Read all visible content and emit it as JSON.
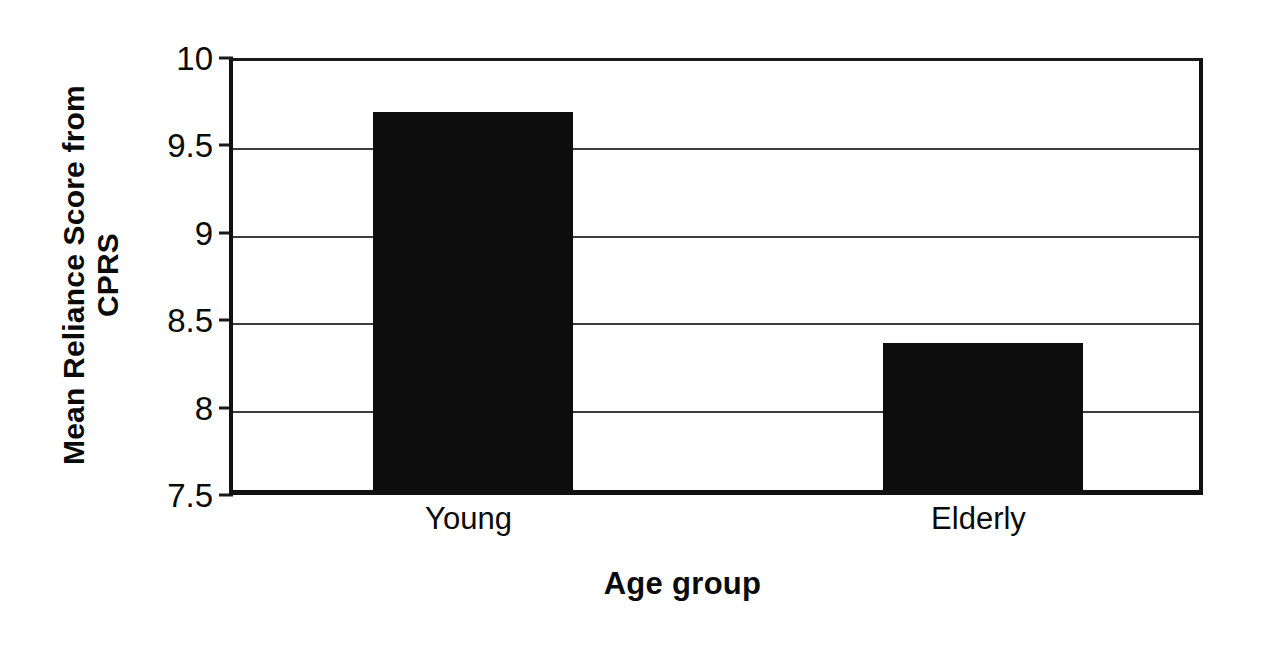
{
  "chart_data": {
    "type": "bar",
    "title": "",
    "categories": [
      "Young",
      "Elderly"
    ],
    "values": [
      9.66,
      8.34
    ],
    "xlabel": "Age group",
    "ylabel": "Mean Reliance Score from CPRS",
    "ylim": [
      7.5,
      10
    ],
    "ytick_labels": [
      "10",
      "9.5",
      "9",
      "8.5",
      "8",
      "7.5"
    ],
    "ytick_values": [
      10,
      9.5,
      9,
      8.5,
      8,
      7.5
    ],
    "grid": true,
    "grid_axis": "y",
    "legend": false,
    "legend_position": "none",
    "bar_color": "#0d0d0d",
    "axis_color": "#111111",
    "grid_color": "#3c3c3c",
    "background": "#ffffff",
    "series": [
      {
        "name": "Mean Reliance Score from CPRS",
        "values": [
          9.66,
          8.34
        ]
      }
    ]
  },
  "axes": {
    "y_title_line1": "Mean Reliance Score from",
    "y_title_line2": "CPRS",
    "y_title_full": "Mean Reliance Score from\nCPRS",
    "x_title": "Age group"
  }
}
